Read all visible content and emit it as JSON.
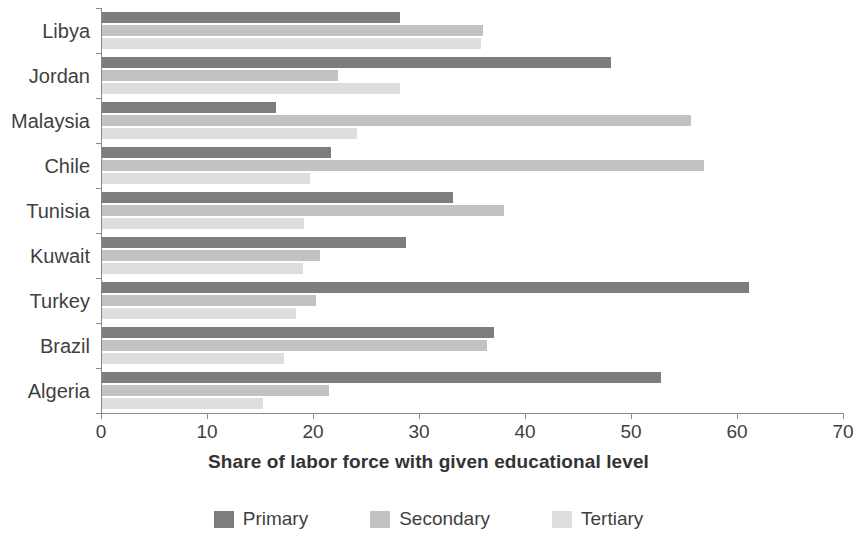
{
  "chart_data": {
    "type": "bar",
    "orientation": "horizontal",
    "title": "",
    "xlabel": "Share of labor force with given educational level",
    "ylabel": "",
    "xlim": [
      0,
      70
    ],
    "xticks": [
      0,
      10,
      20,
      30,
      40,
      50,
      60,
      70
    ],
    "xtick_labels": [
      "0",
      "10",
      "20",
      "30",
      "40",
      "50",
      "60",
      "70"
    ],
    "grid": false,
    "legend_position": "bottom",
    "categories": [
      "Libya",
      "Jordan",
      "Malaysia",
      "Chile",
      "Tunisia",
      "Kuwait",
      "Turkey",
      "Brazil",
      "Algeria"
    ],
    "series": [
      {
        "name": "Primary",
        "color": "#7d7d7d",
        "values": [
          28.1,
          48.0,
          16.4,
          21.6,
          33.1,
          28.7,
          61.0,
          37.0,
          52.7
        ]
      },
      {
        "name": "Secondary",
        "color": "#c2c2c2",
        "values": [
          35.9,
          22.3,
          55.6,
          56.8,
          37.9,
          20.6,
          20.2,
          36.3,
          21.4
        ]
      },
      {
        "name": "Tertiary",
        "color": "#dedede",
        "values": [
          35.8,
          28.1,
          24.1,
          19.6,
          19.1,
          19.0,
          18.3,
          17.2,
          15.2
        ]
      }
    ]
  },
  "axis": {
    "x_title": "Share of labor force with given educational level"
  },
  "legend": {
    "items": [
      {
        "label": "Primary",
        "color": "#7d7d7d",
        "swatch": "primary"
      },
      {
        "label": "Secondary",
        "color": "#c2c2c2",
        "swatch": "secondary"
      },
      {
        "label": "Tertiary",
        "color": "#dedede",
        "swatch": "tertiary"
      }
    ]
  }
}
